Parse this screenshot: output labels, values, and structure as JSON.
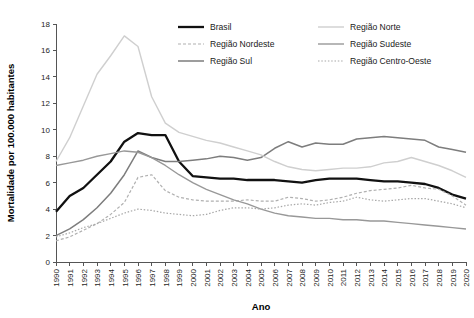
{
  "chart_data": {
    "type": "line",
    "title": "",
    "xlabel": "Ano",
    "ylabel": "Mortalidade por 100.000 habitantes",
    "x": [
      1990,
      1991,
      1992,
      1993,
      1994,
      1995,
      1996,
      1997,
      1998,
      1999,
      2000,
      2001,
      2002,
      2003,
      2004,
      2005,
      2006,
      2007,
      2008,
      2009,
      2010,
      2011,
      2012,
      2013,
      2014,
      2015,
      2016,
      2017,
      2018,
      2019,
      2020
    ],
    "xlim": [
      1990,
      2020
    ],
    "ylim": [
      0,
      18
    ],
    "yticks": [
      0,
      2,
      4,
      6,
      8,
      10,
      12,
      14,
      16,
      18
    ],
    "xticks": [
      "1990",
      "1991",
      "1992",
      "1993",
      "1994",
      "1995",
      "1996",
      "1997",
      "1998",
      "1999",
      "2000",
      "2001",
      "2002",
      "2003",
      "2004",
      "2005",
      "2006",
      "2007",
      "2008",
      "2009",
      "2010",
      "2011",
      "2012",
      "2013",
      "2014",
      "2015",
      "2016",
      "2017",
      "2018",
      "2019",
      "2020"
    ],
    "grid": false,
    "legend_position": "top-center",
    "series": [
      {
        "name": "Brasil",
        "color": "#111111",
        "width": 2.3,
        "dash": "none",
        "values": [
          3.8,
          5.0,
          5.6,
          6.6,
          7.6,
          9.1,
          9.75,
          9.6,
          9.6,
          7.6,
          6.5,
          6.4,
          6.3,
          6.3,
          6.2,
          6.2,
          6.2,
          6.1,
          6.0,
          6.2,
          6.3,
          6.3,
          6.3,
          6.2,
          6.1,
          6.1,
          6.0,
          5.9,
          5.6,
          5.1,
          4.8
        ]
      },
      {
        "name": "Região Nordeste",
        "color": "#b0b0b0",
        "width": 1.2,
        "dash": "3,2",
        "values": [
          1.6,
          1.9,
          2.4,
          2.9,
          3.6,
          4.5,
          6.4,
          6.6,
          5.4,
          4.9,
          4.7,
          4.6,
          4.6,
          4.6,
          4.7,
          4.6,
          4.6,
          4.9,
          4.8,
          4.6,
          4.7,
          4.9,
          5.2,
          5.4,
          5.5,
          5.6,
          5.8,
          5.6,
          5.5,
          5.0,
          4.3
        ]
      },
      {
        "name": "Região Sul",
        "color": "#7d7d7d",
        "width": 1.5,
        "dash": "none",
        "values": [
          2.0,
          2.5,
          3.2,
          4.1,
          5.2,
          6.6,
          8.4,
          7.9,
          7.6,
          7.6,
          7.7,
          7.8,
          8.0,
          7.9,
          7.7,
          7.9,
          8.6,
          9.1,
          8.7,
          9.0,
          8.9,
          8.9,
          9.3,
          9.4,
          9.5,
          9.4,
          9.3,
          9.2,
          8.7,
          8.5,
          8.3
        ]
      },
      {
        "name": "Região Norte",
        "color": "#cfcfcf",
        "width": 1.4,
        "dash": "none",
        "values": [
          7.6,
          9.4,
          11.8,
          14.2,
          15.6,
          17.1,
          16.3,
          12.5,
          10.5,
          9.8,
          9.5,
          9.2,
          9.0,
          8.7,
          8.4,
          8.1,
          7.6,
          7.2,
          7.0,
          6.9,
          7.0,
          7.1,
          7.1,
          7.2,
          7.5,
          7.6,
          7.9,
          7.6,
          7.3,
          6.9,
          6.4
        ]
      },
      {
        "name": "Região Sudeste",
        "color": "#989898",
        "width": 1.4,
        "dash": "none",
        "values": [
          7.3,
          7.5,
          7.7,
          8.0,
          8.2,
          8.4,
          8.3,
          7.9,
          7.3,
          6.6,
          6.0,
          5.5,
          5.1,
          4.7,
          4.4,
          4.0,
          3.7,
          3.5,
          3.4,
          3.3,
          3.3,
          3.2,
          3.2,
          3.1,
          3.1,
          3.0,
          2.9,
          2.8,
          2.7,
          2.6,
          2.5
        ]
      },
      {
        "name": "Região Centro-Oeste",
        "color": "#a8a8a8",
        "width": 1.2,
        "dash": "1.5,1.8",
        "values": [
          1.9,
          2.2,
          2.6,
          2.9,
          3.3,
          3.7,
          4.0,
          3.9,
          3.7,
          3.6,
          3.5,
          3.6,
          3.9,
          4.1,
          4.1,
          4.0,
          4.1,
          4.3,
          4.4,
          4.3,
          4.5,
          4.6,
          4.9,
          4.7,
          4.6,
          4.7,
          4.8,
          4.8,
          4.6,
          4.4,
          4.1
        ]
      }
    ],
    "legend": [
      {
        "label": "Brasil",
        "color": "#111111",
        "width": 2.3,
        "dash": "none"
      },
      {
        "label": "Região Nordeste",
        "color": "#b0b0b0",
        "width": 1.2,
        "dash": "3,2"
      },
      {
        "label": "Região Sul",
        "color": "#7d7d7d",
        "width": 1.5,
        "dash": "none"
      },
      {
        "label": "Região Norte",
        "color": "#cfcfcf",
        "width": 1.4,
        "dash": "none"
      },
      {
        "label": "Região Sudeste",
        "color": "#989898",
        "width": 1.4,
        "dash": "none"
      },
      {
        "label": "Região Centro-Oeste",
        "color": "#a8a8a8",
        "width": 1.2,
        "dash": "1.5,1.8"
      }
    ]
  }
}
